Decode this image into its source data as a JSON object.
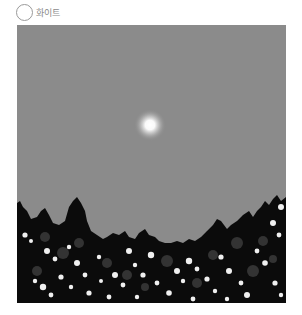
{
  "option": {
    "label": "화이트",
    "selected": false,
    "icon": "radio-circle-icon"
  },
  "image": {
    "description": "night sky with glowing full moon above dark tree silhouettes with white blossoms",
    "colors": {
      "sky": "#8b8b8b",
      "moon": "#ffffff",
      "trees": "#0a0a0a",
      "blossom": "#f2f2f2",
      "leaf_mid": "#3a3a3a"
    }
  }
}
